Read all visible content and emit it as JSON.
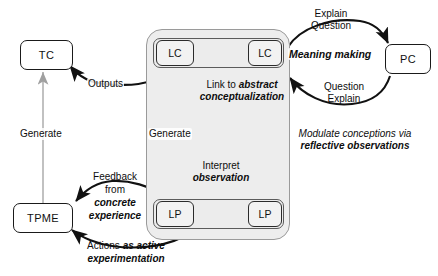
{
  "diagram": {
    "nodes": [
      {
        "id": "tc",
        "label": "TC",
        "kind": "outer-box"
      },
      {
        "id": "tpme",
        "label": "TPME",
        "kind": "outer-box"
      },
      {
        "id": "pc",
        "label": "PC",
        "kind": "outer-box"
      },
      {
        "id": "lc-left",
        "label": "LC",
        "kind": "inner-box"
      },
      {
        "id": "lc-right",
        "label": "LC",
        "kind": "inner-box"
      },
      {
        "id": "lp-left",
        "label": "LP",
        "kind": "inner-box"
      },
      {
        "id": "lp-right",
        "label": "LP",
        "kind": "inner-box"
      }
    ],
    "edge_labels": {
      "outputs": "Outputs",
      "generate_left": "Generate",
      "generate_center": "Generate",
      "link_line1_plain": "Link to ",
      "link_line1_bold": "abstract",
      "link_line2_bold": "conceptualization",
      "modulate_line1": "Modulate conceptions via",
      "modulate_line2": "reflective observations",
      "interpret_line1": "Interpret",
      "interpret_line2": "observation",
      "meaning_making": "Meaning making",
      "explain_top": "Explain",
      "question_top": "Question",
      "question_bottom": "Question",
      "explain_bottom": "Explain",
      "feedback_line1": "Feedback",
      "feedback_line2": "from",
      "feedback_line3": "concrete",
      "feedback_line4": "experience",
      "actions_plain": "Actions ",
      "actions_bold1": "as active",
      "actions_bold2": "experimentation"
    },
    "colors": {
      "stroke_dark": "#1a1a1a",
      "stroke_gray": "#9a9a9a",
      "container_fill": "#ededed",
      "inner_fill": "#f2f2f2",
      "canvas": "#ffffff"
    }
  }
}
